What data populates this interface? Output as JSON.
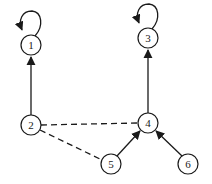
{
  "diagram": {
    "type": "directed-graph",
    "colors": {
      "stroke": "#1a1a1a",
      "background": "#ffffff",
      "node_fill": "#ffffff"
    },
    "nodes": [
      {
        "id": "1",
        "label": "1",
        "x": 31,
        "y": 45,
        "self_loop": true
      },
      {
        "id": "2",
        "label": "2",
        "x": 31,
        "y": 125,
        "self_loop": false
      },
      {
        "id": "3",
        "label": "3",
        "x": 148,
        "y": 38,
        "self_loop": true
      },
      {
        "id": "4",
        "label": "4",
        "x": 148,
        "y": 123,
        "self_loop": false
      },
      {
        "id": "5",
        "label": "5",
        "x": 111,
        "y": 164,
        "self_loop": false
      },
      {
        "id": "6",
        "label": "6",
        "x": 188,
        "y": 164,
        "self_loop": false
      }
    ],
    "edges": [
      {
        "from": "2",
        "to": "1",
        "style": "solid",
        "directed": true
      },
      {
        "from": "4",
        "to": "3",
        "style": "solid",
        "directed": true
      },
      {
        "from": "5",
        "to": "4",
        "style": "solid",
        "directed": true
      },
      {
        "from": "6",
        "to": "4",
        "style": "solid",
        "directed": true
      },
      {
        "from": "2",
        "to": "4",
        "style": "dashed",
        "directed": false
      },
      {
        "from": "2",
        "to": "5",
        "style": "dashed",
        "directed": false
      },
      {
        "from": "1",
        "to": "1",
        "style": "solid",
        "directed": true,
        "loop": true
      },
      {
        "from": "3",
        "to": "3",
        "style": "solid",
        "directed": true,
        "loop": true
      }
    ]
  }
}
